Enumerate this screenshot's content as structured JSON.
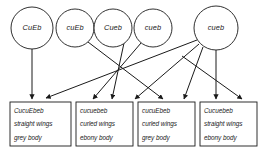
{
  "diagram": {
    "type": "genetic-cross-punnett-gamete-diagram",
    "title": "",
    "gametes": [
      {
        "id": "g1",
        "label": "CuEb",
        "cx": 32,
        "cy": 28,
        "r": 21
      },
      {
        "id": "g2",
        "label": "cuEb",
        "cx": 75,
        "cy": 28,
        "r": 19
      },
      {
        "id": "g3",
        "label": "Cueb",
        "cx": 113,
        "cy": 28,
        "r": 19
      },
      {
        "id": "g4",
        "label": "cueb",
        "cx": 153,
        "cy": 28,
        "r": 19
      },
      {
        "id": "g5",
        "label": "cueb",
        "cx": 216,
        "cy": 28,
        "r": 22
      }
    ],
    "offspring": [
      {
        "id": "o1",
        "x": 10,
        "y": 102,
        "w": 61,
        "h": 44,
        "lines": [
          "CucuEbeb",
          "straight wings",
          "grey body"
        ]
      },
      {
        "id": "o2",
        "x": 76,
        "y": 102,
        "w": 57,
        "h": 44,
        "lines": [
          "cucuebeb",
          "curled wings",
          "ebony body"
        ]
      },
      {
        "id": "o3",
        "x": 138,
        "y": 102,
        "w": 57,
        "h": 44,
        "lines": [
          "cucuEbeb",
          "curled wings",
          "grey body"
        ]
      },
      {
        "id": "o4",
        "x": 200,
        "y": 102,
        "w": 57,
        "h": 44,
        "lines": [
          "Cucuebeb",
          "straight wings",
          "ebony body"
        ]
      }
    ],
    "arrows": [
      {
        "id": "a1",
        "from": "g1",
        "to": "o1",
        "x1": 32,
        "y1": 49,
        "x2": 32,
        "y2": 99
      },
      {
        "id": "a2",
        "from": "g2",
        "to": "o3",
        "x1": 88,
        "y1": 42,
        "x2": 163,
        "y2": 99
      },
      {
        "id": "a3",
        "from": "g3",
        "to": "o2",
        "x1": 124,
        "y1": 43,
        "x2": 112,
        "y2": 99
      },
      {
        "id": "a4",
        "from": "g4",
        "to": "o2",
        "x1": 141,
        "y1": 43,
        "x2": 93,
        "y2": 99
      },
      {
        "id": "a5",
        "from": "g5",
        "to": "o1",
        "x1": 197,
        "y1": 40,
        "x2": 46,
        "y2": 98
      },
      {
        "id": "a6",
        "from": "g5",
        "to": "o2",
        "x1": 199,
        "y1": 44,
        "x2": 135,
        "y2": 99
      },
      {
        "id": "a7",
        "from": "g5",
        "to": "o3",
        "x1": 203,
        "y1": 47,
        "x2": 184,
        "y2": 99
      },
      {
        "id": "a8",
        "from": "g5",
        "to": "o4",
        "x1": 216,
        "y1": 50,
        "x2": 216,
        "y2": 99
      }
    ],
    "extra_arrows": [
      {
        "id": "a9",
        "from": "g5",
        "to": "o4",
        "x1": 182,
        "y1": 56,
        "x2": 242,
        "y2": 99
      }
    ],
    "colors": {
      "stroke": "#1a1a1a",
      "background": "#ffffff",
      "text": "#1a1a1a"
    }
  }
}
